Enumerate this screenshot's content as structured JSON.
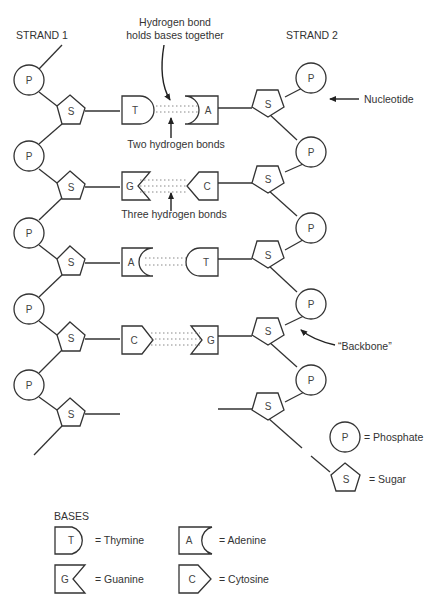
{
  "strands": {
    "strand1": "STRAND 1",
    "strand2": "STRAND 2"
  },
  "annotations": {
    "hbond_line1": "Hydrogen bond",
    "hbond_line2": "holds bases together",
    "two_bonds": "Two hydrogen bonds",
    "three_bonds": "Three hydrogen bonds",
    "nucleotide": "Nucleotide",
    "backbone": "“Backbone”"
  },
  "symbols": {
    "phosphate": "P",
    "sugar": "S"
  },
  "base_pairs": [
    {
      "left": "T",
      "right": "A",
      "bonds": 2
    },
    {
      "left": "G",
      "right": "C",
      "bonds": 3
    },
    {
      "left": "A",
      "right": "T",
      "bonds": 2
    },
    {
      "left": "C",
      "right": "G",
      "bonds": 3
    }
  ],
  "legend": {
    "phosphate": {
      "symbol": "P",
      "label": "= Phosphate"
    },
    "sugar": {
      "symbol": "S",
      "label": "= Sugar"
    },
    "bases_title": "BASES",
    "bases": [
      {
        "symbol": "T",
        "label": "= Thymine"
      },
      {
        "symbol": "A",
        "label": "= Adenine"
      },
      {
        "symbol": "G",
        "label": "= Guanine"
      },
      {
        "symbol": "C",
        "label": "= Cytosine"
      }
    ]
  }
}
